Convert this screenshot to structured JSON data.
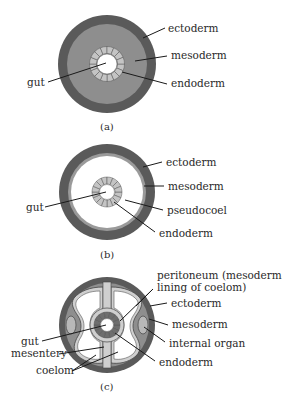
{
  "figure": {
    "colors": {
      "ectoderm": "#5a5a5a",
      "mesoderm": "#8e8e8e",
      "mesoderm_light": "#c9c9c9",
      "endoderm_cell": "#c4c4c4",
      "endoderm_dark": "#6a6a6a",
      "lumen": "#ffffff",
      "outline": "#2a2a2a"
    },
    "panels": [
      {
        "id": "a",
        "caption": "(a)",
        "labels": {
          "ectoderm": "ectoderm",
          "mesoderm": "mesoderm",
          "endoderm": "endoderm",
          "gut": "gut"
        }
      },
      {
        "id": "b",
        "caption": "(b)",
        "labels": {
          "ectoderm": "ectoderm",
          "mesoderm": "mesoderm",
          "pseudocoel": "pseudocoel",
          "endoderm": "endoderm",
          "gut": "gut"
        }
      },
      {
        "id": "c",
        "caption": "(c)",
        "labels": {
          "peritoneum_line1": "peritoneum (mesodermal",
          "peritoneum_line2": "lining of coelom)",
          "ectoderm": "ectoderm",
          "mesoderm": "mesoderm",
          "internal_organ": "internal organ",
          "endoderm": "endoderm",
          "gut": "gut",
          "mesentery": "mesentery",
          "coelom": "coelom"
        }
      }
    ]
  }
}
